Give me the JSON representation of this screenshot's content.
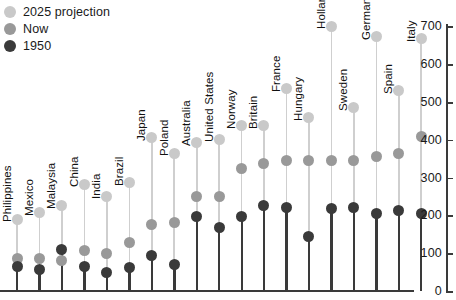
{
  "chart_data": {
    "type": "scatter",
    "title": "",
    "xlabel": "",
    "ylabel": "",
    "ylim": [
      0,
      700
    ],
    "ytick_values": [
      0,
      100,
      200,
      300,
      400,
      500,
      600,
      700
    ],
    "ytick_labels": [
      "0",
      "100",
      "200",
      "300",
      "400",
      "500",
      "600",
      "700"
    ],
    "grid": false,
    "legend_position": "top-left",
    "categories": [
      "Philippines",
      "Mexico",
      "Malaysia",
      "China",
      "India",
      "Brazil",
      "Japan",
      "Poland",
      "Australia",
      "United States",
      "Norway",
      "Britain",
      "France",
      "Hungary",
      "Holland",
      "Sweden",
      "Germany",
      "Spain",
      "Italy"
    ],
    "series": [
      {
        "name": "2025 projection",
        "color": "#c9c9c9",
        "values": [
          190,
          207,
          225,
          283,
          251,
          286,
          405,
          365,
          392,
          402,
          437,
          437,
          535,
          458,
          700,
          485,
          672,
          530,
          667
        ]
      },
      {
        "name": "Now",
        "color": "#999999",
        "values": [
          87,
          87,
          82,
          106,
          98,
          127,
          177,
          180,
          251,
          251,
          323,
          336,
          344,
          344,
          344,
          344,
          357,
          365,
          410
        ]
      },
      {
        "name": "1950",
        "color": "#3a3a3a",
        "values": [
          66,
          58,
          111,
          66,
          48,
          63,
          95,
          69,
          198,
          167,
          198,
          225,
          220,
          143,
          217,
          222,
          206,
          212,
          204
        ]
      }
    ]
  },
  "legend": {
    "items": [
      {
        "label": "2025 projection",
        "color": "#c9c9c9"
      },
      {
        "label": "Now",
        "color": "#999999"
      },
      {
        "label": "1950",
        "color": "#3a3a3a"
      }
    ]
  }
}
